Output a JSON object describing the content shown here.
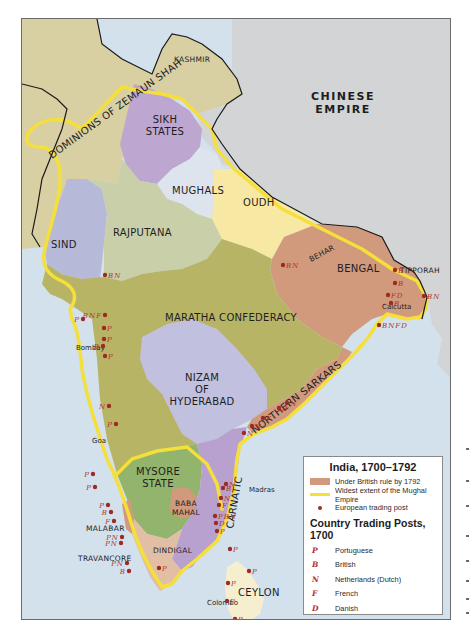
{
  "map": {
    "title": "India, 1700–1792",
    "colors": {
      "sea": "#d2e1ec",
      "chinese_empire": "#d3d4d6",
      "dominions": "#d8d0a2",
      "kashmir": "#d8d0a2",
      "sikh_states": "#bda6cf",
      "mughals": "#dde4ee",
      "oudh": "#f7e8a3",
      "bengal": "#d19a7d",
      "sind": "#b7b9d9",
      "rajputana": "#c9cfa8",
      "maratha": "#b8b466",
      "nizam": "#c1c0df",
      "northern_sarkars": "#d19a7d",
      "mysore": "#93b46c",
      "carnatic": "#b9a1cf",
      "baba_mahal": "#d19a7d",
      "dindigal": "#e2bfa4",
      "ceylon": "#f5efcf",
      "mughal_extent": "#f5df3a",
      "trading_post": "#9e2b22",
      "post_code": "#b2302a"
    },
    "regions": {
      "dominions": "DOMINIONS OF ZEMAUN SHAH",
      "kashmir": "KASHMIR",
      "sikh_line1": "SIKH",
      "sikh_line2": "STATES",
      "chinese_line1": "CHINESE",
      "chinese_line2": "EMPIRE",
      "mughals": "MUGHALS",
      "oudh": "OUDH",
      "sind": "SIND",
      "rajputana": "RAJPUTANA",
      "behar": "BEHAR",
      "bengal": "BENGAL",
      "tipporah": "TIPPORAH",
      "maratha": "MARATHA CONFEDERACY",
      "nizam_line1": "NIZAM",
      "nizam_line2": "OF",
      "nizam_line3": "HYDERABAD",
      "northern_sarkars": "NORTHERN SARKARS",
      "mysore_line1": "MYSORE",
      "mysore_line2": "STATE",
      "baba_line1": "BABA",
      "baba_line2": "MAHAL",
      "carnatic": "CARNATIC",
      "malabar": "MALABAR",
      "dindigal": "DINDIGAL",
      "travancore": "TRAVANCORE",
      "ceylon": "CEYLON"
    },
    "cities": {
      "calcutta": "Calcutta",
      "bombay": "Bombay",
      "goa": "Goa",
      "madras": "Madras",
      "colombo": "Colombo"
    },
    "trading_posts": [
      {
        "place": "Patna",
        "codes": "BN"
      },
      {
        "place": "Bengal inland 1",
        "codes": "B"
      },
      {
        "place": "Bengal inland 2",
        "codes": "B"
      },
      {
        "place": "Calcutta",
        "codes": "FD"
      },
      {
        "place": "Calcutta south",
        "codes": "B"
      },
      {
        "place": "Chittagong",
        "codes": "BN"
      },
      {
        "place": "Orissa coast",
        "codes": "BNFD"
      },
      {
        "place": "Northern Sarkars 1",
        "codes": "N"
      },
      {
        "place": "Northern Sarkars 2",
        "codes": "B"
      },
      {
        "place": "Northern Sarkars 3",
        "codes": "F"
      },
      {
        "place": "Northern Sarkars 4",
        "codes": "N"
      },
      {
        "place": "Northern Sarkars 5",
        "codes": "N"
      },
      {
        "place": "Ahmedabad",
        "codes": "BN"
      },
      {
        "place": "Diu",
        "codes": "P"
      },
      {
        "place": "Surat",
        "codes": "BNF"
      },
      {
        "place": "Daman",
        "codes": "P"
      },
      {
        "place": "Bombay",
        "codes": "P"
      },
      {
        "place": "Bombay south",
        "codes": "B"
      },
      {
        "place": "Chaul",
        "codes": "P"
      },
      {
        "place": "Vengurla",
        "codes": "N"
      },
      {
        "place": "Goa",
        "codes": "P"
      },
      {
        "place": "Canara 1",
        "codes": "P"
      },
      {
        "place": "Canara 2",
        "codes": "P"
      },
      {
        "place": "Malabar 1",
        "codes": "P"
      },
      {
        "place": "Malabar 2",
        "codes": "B"
      },
      {
        "place": "Malabar 3",
        "codes": "F"
      },
      {
        "place": "Cochin 1",
        "codes": "PN"
      },
      {
        "place": "Cochin 2",
        "codes": "PN"
      },
      {
        "place": "Quilon",
        "codes": "PN"
      },
      {
        "place": "Anjengo",
        "codes": "B"
      },
      {
        "place": "Tuticorin",
        "codes": "P"
      },
      {
        "place": "Pulicat",
        "codes": "N"
      },
      {
        "place": "Madras",
        "codes": "B"
      },
      {
        "place": "Sadras",
        "codes": "N"
      },
      {
        "place": "Pondicherry",
        "codes": "F"
      },
      {
        "place": "Cuddalore",
        "codes": "PBN"
      },
      {
        "place": "Tranquebar",
        "codes": "D"
      },
      {
        "place": "Negapatam",
        "codes": "P"
      },
      {
        "place": "Jaffna",
        "codes": "P"
      },
      {
        "place": "Trincomalee",
        "codes": "P"
      },
      {
        "place": "Ceylon west",
        "codes": "P"
      },
      {
        "place": "Colombo",
        "codes": "P"
      },
      {
        "place": "Galle",
        "codes": "P"
      }
    ]
  },
  "legend": {
    "title": "India, 1700–1792",
    "items": [
      {
        "type": "swatch",
        "label": "Under British rule by 1792",
        "color": "#d19a7d"
      },
      {
        "type": "line",
        "label": "Widest extent of the Mughal Empire",
        "color": "#f5df3a"
      },
      {
        "type": "dot",
        "label": "European trading post",
        "color": "#9e2b22"
      }
    ],
    "subtitle": "Country Trading Posts, 1700",
    "posts": [
      {
        "code": "P",
        "label": "Portuguese"
      },
      {
        "code": "B",
        "label": "British"
      },
      {
        "code": "N",
        "label": "Netherlands (Dutch)"
      },
      {
        "code": "F",
        "label": "French"
      },
      {
        "code": "D",
        "label": "Danish"
      }
    ]
  }
}
